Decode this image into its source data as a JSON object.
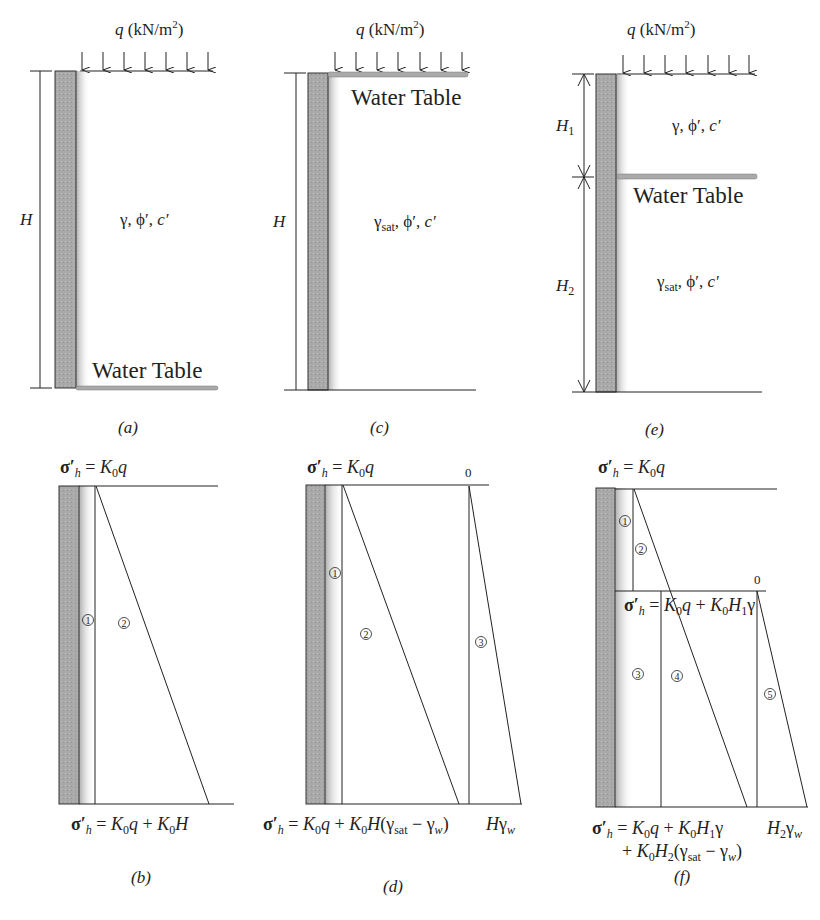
{
  "figure": {
    "panels": {
      "a": {
        "caption": "(a)",
        "load_label": "q (kN/m²)",
        "height_label": "H",
        "soil_props": "γ, ϕ′, c′",
        "water_table_label": "Water Table",
        "water_table_position": "bottom"
      },
      "c": {
        "caption": "(c)",
        "load_label": "q (kN/m²)",
        "height_label": "H",
        "soil_props": "γsat, ϕ′, c′",
        "water_table_label": "Water Table",
        "water_table_position": "top"
      },
      "e": {
        "caption": "(e)",
        "load_label": "q (kN/m²)",
        "height_labels": [
          "H1",
          "H2"
        ],
        "soil_props_upper": "γ, ϕ′, c′",
        "soil_props_lower": "γsat, ϕ′, c′",
        "water_table_label": "Water Table",
        "water_table_position": "middle"
      },
      "b": {
        "caption": "(b)",
        "top_eq": "σ′h = K0q",
        "bottom_eq": "σ′h = K0q + K0H",
        "zones": [
          "1",
          "2"
        ]
      },
      "d": {
        "caption": "(d)",
        "top_eq": "σ′h = K0q",
        "top_zero": "0",
        "bottom_eq": "σ′h = K0q + K0H(γsat − γw)",
        "bottom_water": "Hγw",
        "zones": [
          "1",
          "2",
          "3"
        ]
      },
      "f": {
        "caption": "(f)",
        "top_eq": "σ′h = K0q",
        "mid_zero": "0",
        "mid_eq": "σ′h = K0q + K0H1γ",
        "bottom_eq_line1": "σ′h = K0q + K0H1γ",
        "bottom_eq_line2": "+ K0H2(γsat − γw)",
        "bottom_water": "H2γw",
        "zones": [
          "1",
          "2",
          "3",
          "4",
          "5"
        ]
      }
    }
  }
}
